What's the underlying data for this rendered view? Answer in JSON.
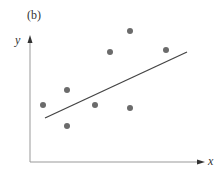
{
  "panel_label": "(b)",
  "chart_data": {
    "type": "scatter",
    "title": "(b)",
    "xlabel": "x",
    "ylabel": "y",
    "grid": false,
    "legend": null,
    "axis_ticks": "none",
    "points_pixel": [
      {
        "x": 43,
        "y": 105
      },
      {
        "x": 67,
        "y": 90
      },
      {
        "x": 67,
        "y": 126
      },
      {
        "x": 95,
        "y": 105
      },
      {
        "x": 110,
        "y": 52
      },
      {
        "x": 130,
        "y": 31
      },
      {
        "x": 130,
        "y": 108
      },
      {
        "x": 166,
        "y": 50
      }
    ],
    "series": [
      {
        "name": "data points",
        "x": [
          0.07,
          0.21,
          0.21,
          0.37,
          0.46,
          0.58,
          0.58,
          0.79
        ],
        "y": [
          0.45,
          0.57,
          0.29,
          0.45,
          0.88,
          1.05,
          0.43,
          0.9
        ]
      }
    ],
    "fit_line": {
      "name": "regression line",
      "pixel_start": {
        "x": 45,
        "y": 118
      },
      "pixel_end": {
        "x": 187,
        "y": 52
      },
      "start": {
        "x": 0.09,
        "y": 0.35
      },
      "end": {
        "x": 0.92,
        "y": 0.88
      }
    },
    "xlim": [
      0,
      1
    ],
    "ylim": [
      0,
      1.1
    ]
  },
  "colors": {
    "points": "#6b6b6b",
    "line": "#444444",
    "axes": "#888888"
  }
}
